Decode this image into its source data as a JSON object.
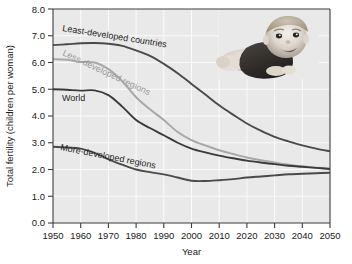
{
  "chart_data": {
    "type": "line",
    "title": "",
    "xlabel": "Year",
    "ylabel": "Total fertility (children per woman)",
    "xlim": [
      1950,
      2050
    ],
    "ylim": [
      0.0,
      8.0
    ],
    "grid": true,
    "legend_position": "inline-curve-labels",
    "xticks": [
      "1950",
      "1960",
      "1970",
      "1980",
      "1990",
      "2000",
      "2010",
      "2020",
      "2030",
      "2040",
      "2050"
    ],
    "yticks": [
      "0.0",
      "1.0",
      "2.0",
      "3.0",
      "4.0",
      "5.0",
      "6.0",
      "7.0",
      "8.0"
    ],
    "x": [
      1950,
      1955,
      1960,
      1965,
      1970,
      1975,
      1980,
      1985,
      1990,
      1995,
      2000,
      2005,
      2010,
      2015,
      2020,
      2025,
      2030,
      2035,
      2040,
      2045,
      2050
    ],
    "series": [
      {
        "name": "Least-developed countries",
        "color": "#4a4a4a",
        "width": 1.9,
        "values": [
          6.65,
          6.68,
          6.72,
          6.73,
          6.7,
          6.62,
          6.45,
          6.25,
          5.95,
          5.6,
          5.2,
          4.8,
          4.4,
          4.05,
          3.72,
          3.45,
          3.22,
          3.05,
          2.9,
          2.78,
          2.68
        ]
      },
      {
        "name": "Less-developed regions",
        "color": "#a8a8a8",
        "width": 2.0,
        "values": [
          6.12,
          6.1,
          6.02,
          6.0,
          5.75,
          5.3,
          4.7,
          4.25,
          3.85,
          3.4,
          3.1,
          2.9,
          2.72,
          2.58,
          2.45,
          2.35,
          2.26,
          2.18,
          2.12,
          2.07,
          2.03
        ]
      },
      {
        "name": "World",
        "color": "#3a3a3a",
        "width": 1.9,
        "values": [
          5.0,
          4.98,
          4.95,
          4.96,
          4.78,
          4.35,
          3.85,
          3.55,
          3.28,
          3.0,
          2.78,
          2.64,
          2.52,
          2.42,
          2.33,
          2.26,
          2.2,
          2.14,
          2.1,
          2.06,
          2.02
        ]
      },
      {
        "name": "More-developed regions",
        "color": "#4a4a4a",
        "width": 1.9,
        "values": [
          2.85,
          2.82,
          2.78,
          2.62,
          2.38,
          2.18,
          2.0,
          1.9,
          1.82,
          1.7,
          1.58,
          1.57,
          1.6,
          1.64,
          1.7,
          1.74,
          1.78,
          1.82,
          1.84,
          1.86,
          1.88
        ]
      }
    ],
    "annotations": [
      {
        "text": "Least-developed countries",
        "kind": "curve-label"
      },
      {
        "text": "Less-developed regions",
        "kind": "curve-label"
      },
      {
        "text": "World",
        "kind": "curve-label"
      },
      {
        "text": "More-developed regions",
        "kind": "curve-label"
      }
    ],
    "decorations": [
      {
        "kind": "photo",
        "description": "baby-photo",
        "alt": "smiling baby lying on stomach"
      }
    ]
  }
}
